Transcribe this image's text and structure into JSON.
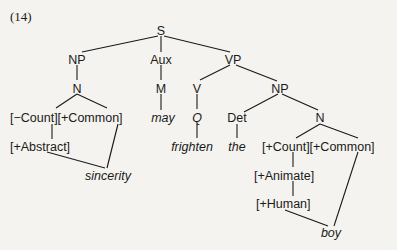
{
  "example_label": "(14)",
  "tree": {
    "root": "S",
    "nodes": {
      "s": "S",
      "np_subject": "NP",
      "aux": "Aux",
      "vp": "VP",
      "n_subject": "N",
      "m": "M",
      "v": "V",
      "np_object": "NP",
      "q": "Q",
      "det": "Det",
      "n_object": "N"
    },
    "features": {
      "subject_row1": "[−Count][+Common]",
      "subject_row2": "[+Abstract]",
      "object_row1": "[+Count][+Common]",
      "object_row2": "[+Animate]",
      "object_row3": "[+Human]"
    },
    "words": {
      "sincerity": "sincerity",
      "may": "may",
      "frighten": "frighten",
      "the": "the",
      "boy": "boy"
    }
  }
}
